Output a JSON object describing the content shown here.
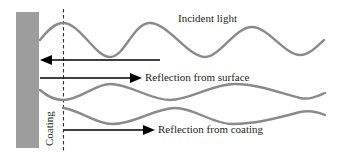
{
  "diagram": {
    "title": "",
    "labels": {
      "incident": "Incident light",
      "reflection_surface": "Reflection from surface",
      "reflection_coating": "Reflection from coating",
      "coating": "Coating"
    },
    "colors": {
      "substrate": "#9d9d9d",
      "wave": "#8a8a8a",
      "arrow": "#000000",
      "text": "#231f20",
      "dashed_line": "#333333"
    },
    "elements": [
      {
        "id": "substrate",
        "type": "rect",
        "description": "gray substrate/surface block"
      },
      {
        "id": "coating-boundary",
        "type": "dashed-line",
        "description": "coating layer boundary"
      },
      {
        "id": "incident-wave",
        "type": "sine-wave",
        "direction": "leftward"
      },
      {
        "id": "surface-reflection-wave",
        "type": "sine-wave",
        "direction": "rightward"
      },
      {
        "id": "coating-reflection-wave",
        "type": "sine-wave",
        "direction": "rightward"
      }
    ]
  }
}
